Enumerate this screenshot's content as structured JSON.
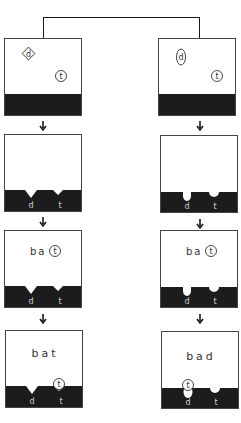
{
  "diagram": {
    "columns": [
      {
        "id": "left",
        "notch_shape": "pointed",
        "steps": [
          {
            "step": 1,
            "tokens": [
              {
                "symbol": "d",
                "shape": "diamond"
              },
              {
                "symbol": "t",
                "shape": "circle"
              }
            ],
            "slot_labels": [],
            "word": ""
          },
          {
            "step": 2,
            "tokens": [],
            "slot_labels": [
              "d",
              "t"
            ],
            "word": ""
          },
          {
            "step": 3,
            "tokens": [],
            "slot_labels": [
              "d",
              "t"
            ],
            "word": "ba",
            "word_circled_letter": "t"
          },
          {
            "step": 4,
            "tokens": [
              {
                "symbol": "t",
                "shape": "circle",
                "fitted_in_slot": "t"
              }
            ],
            "slot_labels": [
              "d",
              "t"
            ],
            "word": "bat"
          }
        ]
      },
      {
        "id": "right",
        "notch_shape": "rounded",
        "steps": [
          {
            "step": 1,
            "tokens": [
              {
                "symbol": "d",
                "shape": "oval"
              },
              {
                "symbol": "t",
                "shape": "circle"
              }
            ],
            "slot_labels": [],
            "word": ""
          },
          {
            "step": 2,
            "tokens": [],
            "slot_labels": [
              "d",
              "t"
            ],
            "word": ""
          },
          {
            "step": 3,
            "tokens": [],
            "slot_labels": [
              "d",
              "t"
            ],
            "word": "ba",
            "word_circled_letter": "t"
          },
          {
            "step": 4,
            "tokens": [
              {
                "symbol": "t",
                "shape": "circle",
                "fitted_in_slot": "d"
              }
            ],
            "slot_labels": [
              "d",
              "t"
            ],
            "word": "bad"
          }
        ]
      }
    ],
    "labels": {
      "d": "d",
      "t": "t",
      "word_step3_prefix": "ba",
      "word_step3_circled": "t",
      "word_left_final": "bat",
      "word_right_final": "bad"
    },
    "colors": {
      "ground": "#1c1c1c",
      "line": "#1a1a1a",
      "paper": "#ffffff"
    }
  }
}
